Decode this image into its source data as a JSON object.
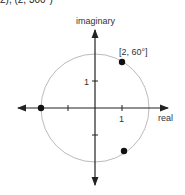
{
  "top_fragment": "2), (2, 300°)",
  "diagram": {
    "axis_labels": {
      "x": "real",
      "y": "imaginary"
    },
    "tick_labels": {
      "x": "1",
      "y": "1"
    },
    "circle": {
      "radius_units": 2,
      "color": "#bbbbbb"
    },
    "point_label": "[2, 60°]",
    "points": [
      {
        "polar": "[2, 60°]",
        "x": 1,
        "y": 1.732
      },
      {
        "polar": "[2, 180°]",
        "x": -2,
        "y": 0
      },
      {
        "polar": "[2, 300°]",
        "x": 1,
        "y": -1.732
      }
    ]
  }
}
